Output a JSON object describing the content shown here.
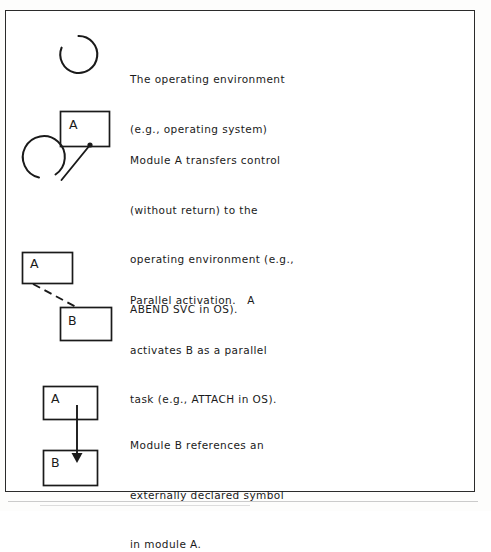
{
  "document": {
    "type": "technical-diagram",
    "title": "Structure chart notation legend",
    "background_color": "#ffffff",
    "ink_color": "#1a1a1a",
    "frame": {
      "name": "figure-frame",
      "stroke_color": "#2b2b2b"
    }
  },
  "entries": [
    {
      "id": "operating-environment",
      "symbol": "open-circle",
      "caption_lines": [
        "The operating environment",
        "(e.g., operating system)"
      ],
      "boxes": [],
      "connector": "none"
    },
    {
      "id": "transfer-control",
      "symbol": "box-to-circle-line",
      "caption_lines": [
        "Module A transfers control",
        "(without return) to the",
        "operating environment (e.g.,",
        "ABEND SVC in OS)."
      ],
      "boxes": [
        {
          "label": "A"
        }
      ],
      "connector": "solid-line-with-origin-dot"
    },
    {
      "id": "parallel-activation",
      "symbol": "two-boxes-dashed-line",
      "caption_lines": [
        "Parallel activation.   A",
        "activates B as a parallel",
        "task (e.g., ATTACH in OS)."
      ],
      "boxes": [
        {
          "label": "A"
        },
        {
          "label": "B"
        }
      ],
      "connector": "dashed-line"
    },
    {
      "id": "external-reference",
      "symbol": "two-boxes-vertical-arrow",
      "caption_lines": [
        "Module B references an",
        "externally declared symbol",
        "in module A."
      ],
      "boxes": [
        {
          "label": "A"
        },
        {
          "label": "B"
        }
      ],
      "connector": "solid-arrow-down"
    }
  ]
}
